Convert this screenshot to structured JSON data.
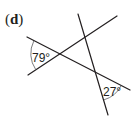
{
  "figure": {
    "label": "(d)",
    "label_open": "(",
    "label_letter": "d",
    "label_close": ")",
    "line_color": "#231f20",
    "arc_color": "#6d6e71",
    "lines": [
      {
        "name": "transversal-1",
        "x1": 27,
        "y1": 37,
        "x2": 130,
        "y2": 90
      },
      {
        "name": "transversal-2",
        "x1": 28,
        "y1": 75,
        "x2": 117,
        "y2": 16
      },
      {
        "name": "transversal-3",
        "x1": 78,
        "y1": 14,
        "x2": 108,
        "y2": 115
      }
    ],
    "angles": [
      {
        "value": "79°",
        "text_x": 32,
        "text_y": 62
      },
      {
        "value": "27°",
        "text_x": 103,
        "text_y": 96
      }
    ]
  }
}
